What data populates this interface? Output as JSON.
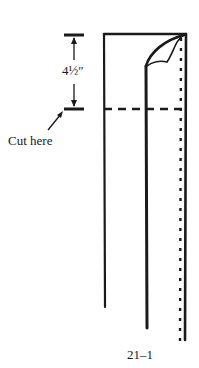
{
  "diagram": {
    "measurement_label": "4½″",
    "cut_label": "Cut here",
    "figure_number": "21–1",
    "colors": {
      "ink": "#1a1a1a",
      "background": "#ffffff"
    }
  }
}
